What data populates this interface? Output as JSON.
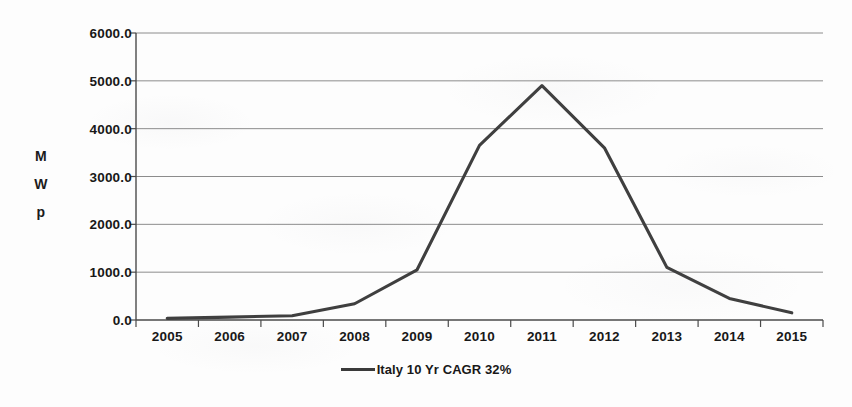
{
  "chart_data": {
    "type": "line",
    "title": "",
    "subtitle": "",
    "xlabel": "",
    "ylabel": "MWp",
    "ylabel_chars": [
      "M",
      "W",
      "p"
    ],
    "categories": [
      "2005",
      "2006",
      "2007",
      "2008",
      "2009",
      "2010",
      "2011",
      "2012",
      "2013",
      "2014",
      "2015"
    ],
    "series": [
      {
        "name": "Italy 10 Yr CAGR 32%",
        "color": "#3f3f3f",
        "values": [
          35,
          60,
          90,
          340,
          1050,
          3650,
          4900,
          3600,
          1100,
          450,
          150
        ]
      }
    ],
    "ylim": [
      0,
      6000
    ],
    "ytick_step": 1000,
    "ytick_labels": [
      "0.0",
      "1000.0",
      "2000.0",
      "3000.0",
      "4000.0",
      "5000.0",
      "6000.0"
    ],
    "ytick_values": [
      0,
      1000,
      2000,
      3000,
      4000,
      5000,
      6000
    ],
    "grid": "horizontal",
    "legend_position": "bottom-center",
    "legend_entries": [
      {
        "label": "Italy 10 Yr CAGR 32%",
        "marker": "line",
        "color": "#3a3a3a"
      }
    ],
    "axis_color": "#4a4a4a",
    "grid_color": "#8c8c8c",
    "background_color": "#fdfdfd"
  },
  "plot_geometry": {
    "left": 136,
    "right": 823,
    "top": 33,
    "bottom": 320
  }
}
